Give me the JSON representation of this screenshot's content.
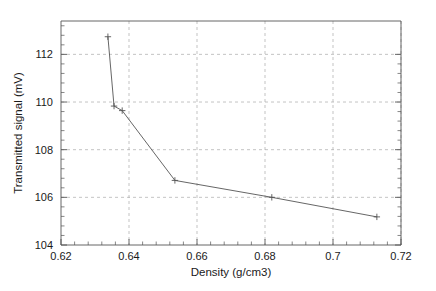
{
  "chart_data": {
    "type": "line",
    "title": "",
    "xlabel": "Density (g/cm3)",
    "ylabel": "Transmitted signal (mV)",
    "xlim": [
      0.62,
      0.72
    ],
    "ylim": [
      104,
      113.4
    ],
    "grid": true,
    "legend": false,
    "xticks": [
      0.62,
      0.64,
      0.66,
      0.68,
      0.7,
      0.72
    ],
    "xticklabels": [
      "0.62",
      "0.64",
      "0.66",
      "0.68",
      "0.7",
      "0.72"
    ],
    "yticks": [
      104,
      106,
      108,
      110,
      112
    ],
    "yticklabels": [
      "104",
      "106",
      "108",
      "110",
      "112"
    ],
    "x_minor_tick_count": 4,
    "y_minor_tick_count": 4,
    "marker": "plus",
    "line_color": "#555555",
    "grid_color": "#aaaaaa",
    "axis_color": "#555555",
    "series": [
      {
        "name": "Transmitted signal",
        "x": [
          0.6338,
          0.6356,
          0.638,
          0.6535,
          0.682,
          0.7129
        ],
        "y": [
          112.74,
          109.83,
          109.64,
          106.71,
          106.0,
          105.18
        ]
      }
    ]
  },
  "axis": {
    "x_title": "Density (g/cm3)",
    "y_title": "Transmitted signal (mV)"
  },
  "ticks": {
    "x": [
      "0.62",
      "0.64",
      "0.66",
      "0.68",
      "0.7",
      "0.72"
    ],
    "y": [
      "104",
      "106",
      "108",
      "110",
      "112"
    ]
  }
}
